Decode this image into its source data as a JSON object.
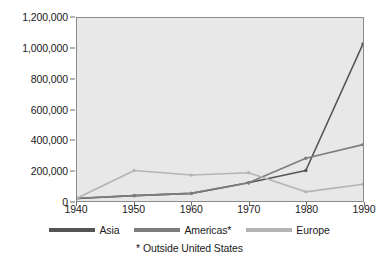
{
  "chart_data": {
    "type": "line",
    "title": "",
    "xlabel": "",
    "ylabel": "",
    "x": [
      1940,
      1950,
      1960,
      1970,
      1980,
      1990
    ],
    "xticklabels": [
      "1940",
      "1950",
      "1960",
      "1970",
      "1980",
      "1990"
    ],
    "yticklabels": [
      "0",
      "200,000",
      "400,000",
      "600,000",
      "800,000",
      "1,000,000",
      "1,200,000"
    ],
    "yticks": [
      0,
      200000,
      400000,
      600000,
      800000,
      1000000,
      1200000
    ],
    "xlim": [
      1940,
      1990
    ],
    "ylim": [
      0,
      1200000
    ],
    "grid": false,
    "legend_position": "bottom",
    "plot_background": "#e8e8e8",
    "series": [
      {
        "name": "Asia",
        "color": "#555555",
        "values": [
          16000,
          35000,
          50000,
          120000,
          200000,
          1030000
        ]
      },
      {
        "name": "Americas*",
        "color": "#7d7d7d",
        "values": [
          18000,
          35000,
          50000,
          120000,
          280000,
          370000
        ]
      },
      {
        "name": "Europe",
        "color": "#b4b4b4",
        "values": [
          18000,
          200000,
          170000,
          185000,
          60000,
          110000
        ]
      }
    ],
    "annotations": [
      "* Outside United States"
    ]
  },
  "legend": {
    "items": [
      {
        "label": "Asia"
      },
      {
        "label": "Americas*"
      },
      {
        "label": "Europe"
      }
    ]
  },
  "footnote": "* Outside United States"
}
